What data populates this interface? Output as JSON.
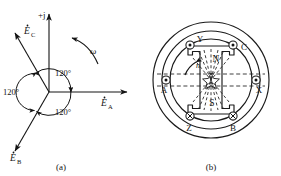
{
  "figure": {
    "panels": [
      {
        "id": "a",
        "caption": "(a)",
        "title": "three-phase emf phasor diagram",
        "axis_imag_label": "+j",
        "rotation_label": "ω",
        "phasors": [
          {
            "name": "E_A",
            "symbol": "E",
            "subscript": "A",
            "angle_deg": 0,
            "label": "E"
          },
          {
            "name": "E_B",
            "symbol": "E",
            "subscript": "B",
            "angle_deg": -120,
            "label": "E"
          },
          {
            "name": "E_C",
            "symbol": "E",
            "subscript": "C",
            "angle_deg": 120,
            "label": "E"
          }
        ],
        "angle_labels": [
          "120°",
          "120°",
          "120°"
        ],
        "subscripts": {
          "a": "A",
          "b": "B",
          "c": "C"
        }
      },
      {
        "id": "b",
        "caption": "(b)",
        "title": "two-pole rotor with three-phase stator windings",
        "rotor_poles": [
          "N",
          "S"
        ],
        "speed_label": "n",
        "slot_labels": [
          "Y",
          "C",
          "X",
          "B",
          "Z",
          "A"
        ],
        "slots": [
          {
            "label": "Y",
            "angle_deg": 120,
            "mark": "dot"
          },
          {
            "label": "C",
            "angle_deg": 60,
            "mark": "dot"
          },
          {
            "label": "X",
            "angle_deg": 0,
            "mark": "dot"
          },
          {
            "label": "B",
            "angle_deg": -60,
            "mark": "cross"
          },
          {
            "label": "Z",
            "angle_deg": -120,
            "mark": "cross"
          },
          {
            "label": "A",
            "angle_deg": 180,
            "mark": "dot"
          }
        ]
      }
    ]
  },
  "colors": {
    "ink": "#141414",
    "line": "#1a1a1a",
    "background": "#ffffff",
    "flux_dash": "#2a2a2a"
  }
}
